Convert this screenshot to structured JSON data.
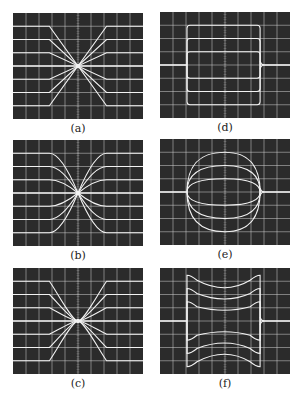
{
  "figure": {
    "panels": [
      {
        "id": "a",
        "label": "(a)",
        "type": "converging-lines",
        "left": 13,
        "top": 13
      },
      {
        "id": "b",
        "label": "(b)",
        "type": "converging-curves",
        "left": 13,
        "top": 140
      },
      {
        "id": "c",
        "label": "(c)",
        "type": "converging-curves-tight",
        "left": 13,
        "top": 268
      },
      {
        "id": "d",
        "label": "(d)",
        "type": "rectangular-pulses",
        "left": 160,
        "top": 12
      },
      {
        "id": "e",
        "label": "(e)",
        "type": "convex-pulses",
        "left": 160,
        "top": 139
      },
      {
        "id": "f",
        "label": "(f)",
        "type": "concave-pulses",
        "left": 160,
        "top": 268
      }
    ],
    "grid": {
      "columns": 10,
      "rows": 8,
      "color": "#cfcfcf",
      "background": "#2b2b2b"
    },
    "trace_color": "#f2f2f2"
  }
}
